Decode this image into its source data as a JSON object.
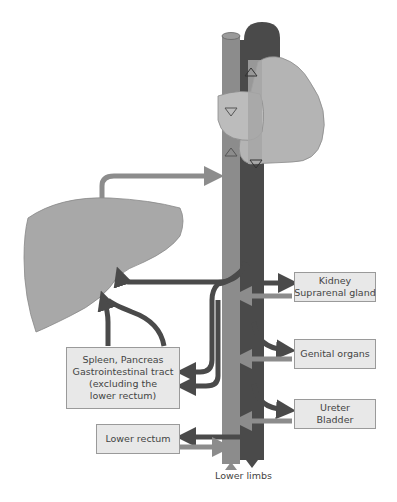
{
  "diagram": {
    "title": "",
    "colors": {
      "vein": "#8c8c8c",
      "artery": "#4a4a4a",
      "organ": "#a8a8a8",
      "heart_light": "#b4b4b4",
      "box_fill": "#e8e8e8",
      "box_border": "#9a9a9a"
    },
    "labels": {
      "kidney": {
        "line1": "Kidney",
        "line2": "Suprarenal gland"
      },
      "genital": {
        "line1": "Genital organs"
      },
      "ureter": {
        "line1": "Ureter",
        "line2": "Bladder"
      },
      "spleen": {
        "line1": "Spleen, Pancreas",
        "line2": "Gastrointestinal tract",
        "line3": "(excluding the",
        "line4": "lower rectum)"
      },
      "rectum": {
        "line1": "Lower rectum"
      },
      "lower_limbs": "Lower limbs"
    },
    "structures": [
      "Heart",
      "Liver",
      "Inferior vena cava",
      "Aorta",
      "Hepatic portal vein"
    ]
  }
}
